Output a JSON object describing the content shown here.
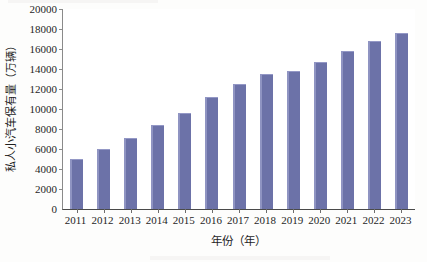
{
  "chart_data": {
    "type": "bar",
    "title": "",
    "xlabel": "年份（年）",
    "ylabel": "私人小汽车保有量（万辆）",
    "categories": [
      "2011",
      "2012",
      "2013",
      "2014",
      "2015",
      "2016",
      "2017",
      "2018",
      "2019",
      "2020",
      "2021",
      "2022",
      "2023"
    ],
    "values": [
      5050,
      6050,
      7150,
      8400,
      9650,
      11200,
      12550,
      13550,
      13800,
      14750,
      15850,
      16800,
      17600
    ],
    "ylim": [
      0,
      20000
    ],
    "ytick_values": [
      0,
      2000,
      4000,
      6000,
      8000,
      10000,
      12000,
      14000,
      16000,
      18000,
      20000
    ],
    "ytick_labels": [
      "0",
      "2000",
      "4000",
      "6000",
      "8000",
      "10000",
      "12000",
      "14000",
      "16000",
      "18000",
      "20000"
    ],
    "grid": false,
    "legend": null,
    "series": [
      {
        "name": "私人小汽车保有量",
        "values": [
          5050,
          6050,
          7150,
          8400,
          9650,
          11200,
          12550,
          13550,
          13800,
          14750,
          15850,
          16800,
          17600
        ]
      }
    ],
    "colors": {
      "bar_fill": "#6c72a8",
      "bar_highlight": "#8f94c2",
      "axis": "#4a4a4a",
      "text": "#1f1f1f",
      "background": "#ffffff"
    }
  }
}
